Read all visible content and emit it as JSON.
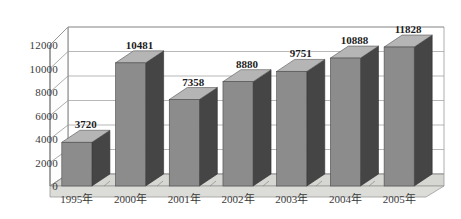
{
  "chart_data": {
    "type": "bar",
    "title": "",
    "subtitle": "",
    "xlabel": "",
    "ylabel": "",
    "categories": [
      "1995年",
      "2000年",
      "2001年",
      "2002年",
      "2003年",
      "2004年",
      "2005年"
    ],
    "values": [
      3720,
      10481,
      7358,
      8880,
      9751,
      10888,
      11828
    ],
    "value_labels": [
      "3720",
      "10481",
      "7358",
      "8880",
      "9751",
      "10888",
      "11828"
    ],
    "ylim": [
      0,
      12000
    ],
    "ytick_values": [
      0,
      2000,
      4000,
      6000,
      8000,
      10000,
      12000
    ],
    "ytick_labels": [
      "0",
      "2000",
      "4000",
      "6000",
      "8000",
      "10000",
      "12000"
    ],
    "grid": true,
    "legend": false,
    "legend_position": "none",
    "three_d": true,
    "series": [
      {
        "name": "",
        "values": [
          3720,
          10481,
          7358,
          8880,
          9751,
          10888,
          11828
        ]
      }
    ]
  },
  "style": {
    "bar_front_color": "#8c8c8c",
    "bar_side_color": "#454545",
    "bar_top_color": "#b5b5b5",
    "floor_color": "#d6d6d2",
    "wall_color": "#ffffff",
    "grid_color": "#8a8a8a",
    "axis_color": "#6e6e6e",
    "text_color": "#2b2b2b",
    "background_color": "#ffffff"
  }
}
